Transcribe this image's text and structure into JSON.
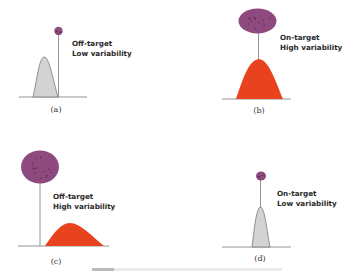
{
  "figure": {
    "panels": [
      {
        "id": "a",
        "label": "(a)",
        "line1": "Off-target",
        "line2": "Low variability",
        "target": "off",
        "variability": "low"
      },
      {
        "id": "b",
        "label": "(b)",
        "line1": "On-target",
        "line2": "High variability",
        "target": "on",
        "variability": "high"
      },
      {
        "id": "c",
        "label": "(c)",
        "line1": "Off-target",
        "line2": "High variability",
        "target": "off",
        "variability": "high"
      },
      {
        "id": "d",
        "label": "(d)",
        "line1": "On-target",
        "line2": "Low variability",
        "target": "on",
        "variability": "low"
      }
    ],
    "colors": {
      "target_fill": "#8e4a7e",
      "target_speck": "#3a1a33",
      "high_variability_fill": "#e8431e",
      "low_variability_fill": "#d3d3d3",
      "low_variability_stroke": "#6a6a6a",
      "line": "#7a7a7a"
    }
  }
}
